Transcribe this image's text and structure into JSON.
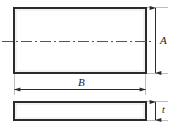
{
  "drawing": {
    "title": "Plate dimension drawing",
    "type": "engineering-drawing",
    "views": [
      {
        "id": "front-view",
        "name": "front-view-rectangle",
        "shape": "rectangle",
        "x": 13,
        "y": 7,
        "width": 133,
        "height": 66,
        "stroke": "#2b2b2b",
        "stroke_width": 2,
        "fill": "#ffffff"
      },
      {
        "id": "edge-view",
        "name": "edge-view-rectangle",
        "shape": "rectangle",
        "x": 13,
        "y": 101,
        "width": 133,
        "height": 19,
        "stroke": "#2b2b2b",
        "stroke_width": 2,
        "fill": "#ffffff"
      }
    ],
    "centerline": {
      "name": "horizontal-centerline",
      "style": "dash-dot",
      "x1": 2,
      "y1": 41,
      "x2": 153,
      "y2": 41,
      "stroke": "#555555"
    },
    "dimensions": [
      {
        "id": "dim-A",
        "label": "A",
        "orientation": "vertical",
        "line_x": 155,
        "y_start": 7,
        "y_end": 73,
        "extension_from": 146,
        "extension_to": 167,
        "stroke": "#2b2b2b"
      },
      {
        "id": "dim-B",
        "label": "B",
        "orientation": "horizontal",
        "line_y": 89,
        "x_start": 14,
        "x_end": 146,
        "extension_from": 73,
        "extension_to": 95,
        "stroke": "#2b2b2b"
      },
      {
        "id": "dim-t",
        "label": "t",
        "orientation": "vertical",
        "line_x": 155,
        "y_start": 101,
        "y_end": 120,
        "extension_from": 146,
        "extension_to": 167,
        "stroke": "#2b2b2b"
      }
    ],
    "colors": {
      "outline": "#2b2b2b",
      "centerline": "#555555",
      "extension": "#b9b9b9",
      "dimension": "#2b2b2b",
      "background": "#ffffff",
      "text": "#1a1a1a"
    }
  }
}
